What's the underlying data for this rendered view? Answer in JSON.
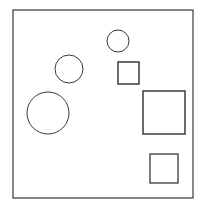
{
  "canvas": {
    "width": 202,
    "height": 206,
    "background": "#ffffff"
  },
  "stroke_color": "#3a3a3a",
  "frame": {
    "x": 13,
    "y": 10,
    "width": 180,
    "height": 188
  },
  "shapes": {
    "circles": [
      {
        "id": "small",
        "cx": 118,
        "cy": 41,
        "r": 11
      },
      {
        "id": "medium",
        "cx": 69,
        "cy": 69,
        "r": 14
      },
      {
        "id": "large",
        "cx": 48,
        "cy": 113,
        "r": 21
      }
    ],
    "squares": [
      {
        "id": "small",
        "x": 118,
        "y": 62,
        "width": 21,
        "height": 22
      },
      {
        "id": "large",
        "x": 143,
        "y": 91,
        "width": 42,
        "height": 43
      },
      {
        "id": "bottom",
        "x": 150,
        "y": 154,
        "width": 28,
        "height": 29
      }
    ]
  }
}
